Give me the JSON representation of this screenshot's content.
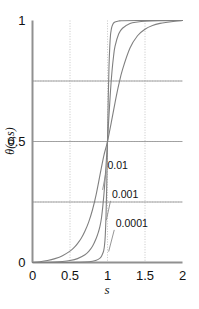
{
  "chart_data": {
    "type": "line",
    "title": "",
    "subtitle": "",
    "xlabel": "s",
    "ylabel": "θ(σ,s)",
    "xlim": [
      0,
      2
    ],
    "ylim": [
      0,
      1
    ],
    "xticks": [
      0,
      0.5,
      1,
      1.5,
      2
    ],
    "xticklabels": [
      "0",
      "0.5",
      "1",
      "1.5",
      "2"
    ],
    "yticks": [
      0,
      0.5,
      1
    ],
    "yticklabels": [
      "0",
      "0.5",
      "1"
    ],
    "grid": true,
    "grid_style": "dotted",
    "grid_color": "#b8b8b8",
    "grid_x": [
      0.5,
      1.0,
      1.5
    ],
    "grid_y": [
      0.25,
      0.5,
      0.75
    ],
    "legend": "inline-annotations",
    "legend_position": "inside-right-of-transition",
    "line_color": "#808080",
    "axis_color": "#909090",
    "background": "#ffffff",
    "series": [
      {
        "name": "0.01",
        "label": "0.01",
        "sigma": 0.01,
        "x": [
          0.0,
          0.1,
          0.2,
          0.3,
          0.4,
          0.5,
          0.55,
          0.6,
          0.65,
          0.7,
          0.75,
          0.8,
          0.85,
          0.9,
          0.95,
          1.0,
          1.05,
          1.1,
          1.15,
          1.2,
          1.3,
          1.4,
          1.5,
          1.6,
          1.7,
          1.8,
          1.9,
          2.0
        ],
        "y": [
          0.0,
          0.003,
          0.008,
          0.016,
          0.028,
          0.047,
          0.06,
          0.078,
          0.1,
          0.13,
          0.168,
          0.218,
          0.283,
          0.362,
          0.44,
          0.5,
          0.578,
          0.66,
          0.735,
          0.797,
          0.886,
          0.937,
          0.964,
          0.979,
          0.988,
          0.993,
          0.997,
          1.0
        ]
      },
      {
        "name": "0.001",
        "label": "0.001",
        "sigma": 0.001,
        "x": [
          0.0,
          0.1,
          0.2,
          0.3,
          0.4,
          0.5,
          0.6,
          0.7,
          0.75,
          0.8,
          0.85,
          0.88,
          0.9,
          0.92,
          0.94,
          0.96,
          0.98,
          1.0,
          1.02,
          1.04,
          1.06,
          1.08,
          1.1,
          1.15,
          1.2,
          1.3,
          1.4,
          1.5,
          1.7,
          2.0
        ],
        "y": [
          0.0,
          0.0,
          0.001,
          0.002,
          0.004,
          0.008,
          0.016,
          0.032,
          0.046,
          0.067,
          0.1,
          0.127,
          0.15,
          0.185,
          0.24,
          0.31,
          0.4,
          0.5,
          0.61,
          0.71,
          0.79,
          0.85,
          0.893,
          0.945,
          0.968,
          0.988,
          0.994,
          0.997,
          0.999,
          1.0
        ]
      },
      {
        "name": "0.0001",
        "label": "0.0001",
        "sigma": 0.0001,
        "x": [
          0.0,
          0.2,
          0.4,
          0.6,
          0.7,
          0.8,
          0.85,
          0.9,
          0.92,
          0.94,
          0.95,
          0.96,
          0.97,
          0.98,
          0.99,
          1.0,
          1.01,
          1.02,
          1.03,
          1.04,
          1.05,
          1.06,
          1.08,
          1.1,
          1.15,
          1.2,
          1.4,
          1.7,
          2.0
        ],
        "y": [
          0.0,
          0.0,
          0.0,
          0.001,
          0.002,
          0.005,
          0.009,
          0.018,
          0.026,
          0.04,
          0.05,
          0.07,
          0.11,
          0.19,
          0.32,
          0.5,
          0.68,
          0.81,
          0.89,
          0.94,
          0.962,
          0.976,
          0.989,
          0.994,
          0.998,
          0.999,
          1.0,
          1.0,
          1.0
        ]
      }
    ],
    "annotations": [
      {
        "text": "0.01",
        "text_x": 1.0,
        "text_y": 0.385,
        "tip_x": 0.935,
        "tip_y": 0.3
      },
      {
        "text": "0.001",
        "text_x": 1.06,
        "text_y": 0.265,
        "tip_x": 0.985,
        "tip_y": 0.175
      },
      {
        "text": "0.0001",
        "text_x": 1.11,
        "text_y": 0.145,
        "tip_x": 1.015,
        "tip_y": 0.045
      }
    ]
  }
}
